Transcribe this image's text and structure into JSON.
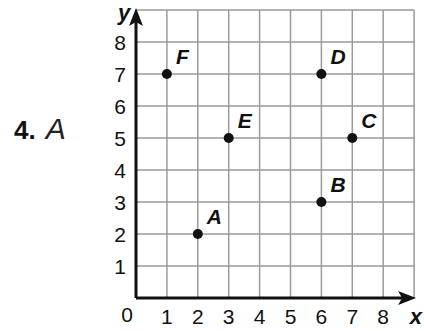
{
  "problem": {
    "number": "4.",
    "answer": "A"
  },
  "axes": {
    "x_label": "x",
    "y_label": "y",
    "origin_label": "0",
    "x_ticks": [
      "1",
      "2",
      "3",
      "4",
      "5",
      "6",
      "7",
      "8"
    ],
    "y_ticks": [
      "1",
      "2",
      "3",
      "4",
      "5",
      "6",
      "7",
      "8"
    ]
  },
  "chart_data": {
    "type": "scatter",
    "title": "",
    "xlabel": "x",
    "ylabel": "y",
    "xlim": [
      0,
      9
    ],
    "ylim": [
      0,
      9
    ],
    "grid": true,
    "points": [
      {
        "label": "A",
        "x": 2,
        "y": 2
      },
      {
        "label": "B",
        "x": 6,
        "y": 3
      },
      {
        "label": "C",
        "x": 7,
        "y": 5
      },
      {
        "label": "D",
        "x": 6,
        "y": 7
      },
      {
        "label": "E",
        "x": 3,
        "y": 5
      },
      {
        "label": "F",
        "x": 1,
        "y": 7
      }
    ]
  }
}
